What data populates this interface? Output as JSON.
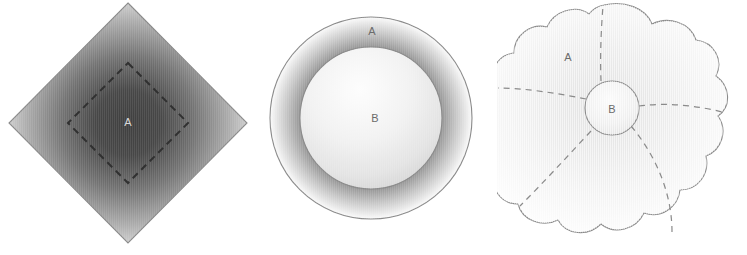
{
  "figure": {
    "background_color": "#ffffff",
    "panels": [
      {
        "id": "diamond",
        "name": "square-rotated-with-inner-dashed-square",
        "outline_color": "#8a8a8a",
        "dashed_color": "#3a3a3a",
        "gradient": {
          "edge_color": "#fafafa",
          "mid_color": "#b4b4b4",
          "center_color": "#3f3f3f"
        },
        "labels": [
          {
            "text": "A",
            "x": 128,
            "y": 123,
            "tone": "light"
          }
        ],
        "outer_vertices": [
          {
            "x": 128,
            "y": 3
          },
          {
            "x": 247,
            "y": 123
          },
          {
            "x": 128,
            "y": 243
          },
          {
            "x": 9,
            "y": 123
          }
        ],
        "inner_vertices": [
          {
            "x": 128,
            "y": 63
          },
          {
            "x": 188,
            "y": 123
          },
          {
            "x": 128,
            "y": 183
          },
          {
            "x": 68,
            "y": 123
          }
        ]
      },
      {
        "id": "annulus",
        "name": "outer-circle-with-inner-circle",
        "outline_color": "#8a8a8a",
        "gradient": {
          "edge_color": "#fbfbfb",
          "mid_color": "#4d4d4d",
          "center_color": "#efefef"
        },
        "labels": [
          {
            "text": "A",
            "x": 372,
            "y": 32,
            "tone": "dark"
          },
          {
            "text": "B",
            "x": 375,
            "y": 119,
            "tone": "dark"
          }
        ],
        "outer_circle": {
          "cx": 371,
          "cy": 118,
          "r": 101
        },
        "inner_circle": {
          "cx": 371,
          "cy": 118,
          "r": 71
        }
      },
      {
        "id": "lobed",
        "name": "lobed-cloud-with-central-circle-and-dashed-partitions",
        "outline_color": "#8a8a8a",
        "dashed_color": "#8a8a8a",
        "gradient": {
          "edge_color": "#ffffff",
          "mid_color": "#f2f2f2",
          "center_color": "#e2e2e2"
        },
        "labels": [
          {
            "text": "A",
            "x": 568,
            "y": 58,
            "tone": "dark"
          },
          {
            "text": "B",
            "x": 612,
            "y": 110,
            "tone": "dark"
          }
        ],
        "central_circle": {
          "cx": 612,
          "cy": 108,
          "r": 27
        },
        "lobe_count": 4,
        "partition_count": 4
      }
    ]
  }
}
